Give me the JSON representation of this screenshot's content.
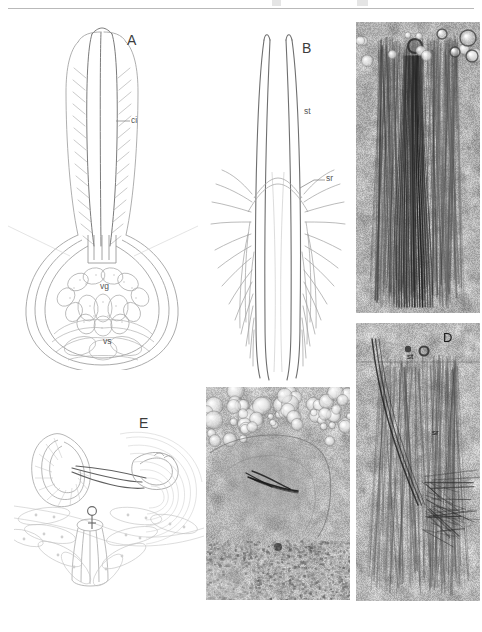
{
  "figure": {
    "background_color": "#ffffff",
    "ink_color": "#8a8a8a",
    "label_color": "#4a4a4a",
    "width": 482,
    "height": 632,
    "header_rule": true
  },
  "panels": [
    {
      "id": "A",
      "letter": "A",
      "type": "line-drawing",
      "description": "Copulatory organ: elongate cirrus apparatus above a bulbous vesicle",
      "labels": [
        {
          "text": "ci",
          "meaning": "cirrus",
          "x": 131,
          "y": 121
        },
        {
          "text": "vg",
          "meaning": "vesicula granulorum",
          "x": 100,
          "y": 286
        },
        {
          "text": "vs",
          "meaning": "vesicula seminalis",
          "x": 103,
          "y": 341
        }
      ],
      "letter_pos": {
        "x": 127,
        "y": 41
      }
    },
    {
      "id": "B",
      "letter": "B",
      "type": "line-drawing",
      "description": "Stylet pair flanked by lateral spines / bristles",
      "labels": [
        {
          "text": "st",
          "meaning": "stylet",
          "x": 304,
          "y": 111
        },
        {
          "text": "sr",
          "meaning": "spine row",
          "x": 326,
          "y": 178
        }
      ],
      "letter_pos": {
        "x": 302,
        "y": 49
      }
    },
    {
      "id": "C",
      "letter": "",
      "type": "micrograph",
      "description": "Light micrograph of stylet region with granular tissue",
      "labels": [],
      "letter_pos": null
    },
    {
      "id": "D",
      "letter": "D",
      "type": "micrograph",
      "description": "Light micrograph of stylet and spine row",
      "labels": [
        {
          "text": "st",
          "meaning": "stylet",
          "x": 407,
          "y": 356
        },
        {
          "text": "sr",
          "meaning": "spine row",
          "x": 432,
          "y": 432
        }
      ],
      "letter_pos": {
        "x": 443,
        "y": 338
      }
    },
    {
      "id": "E",
      "letter": "E",
      "type": "line-drawing",
      "description": "Female genital region with gonopore marked by Venus symbol",
      "labels": [
        {
          "text": "♀",
          "meaning": "female-gonopore-symbol",
          "x": 90,
          "y": 512
        }
      ],
      "letter_pos": {
        "x": 139,
        "y": 424
      }
    },
    {
      "id": "F",
      "letter": "",
      "type": "micrograph",
      "description": "Light micrograph of stylet within tissue, bright globular cells above",
      "labels": [],
      "letter_pos": null
    }
  ],
  "legend_keys": [
    {
      "abbrev": "ci",
      "term": "cirrus"
    },
    {
      "abbrev": "st",
      "term": "stylet"
    },
    {
      "abbrev": "sr",
      "term": "spine row"
    },
    {
      "abbrev": "vg",
      "term": "vesicula granulorum"
    },
    {
      "abbrev": "vs",
      "term": "vesicula seminalis"
    }
  ]
}
